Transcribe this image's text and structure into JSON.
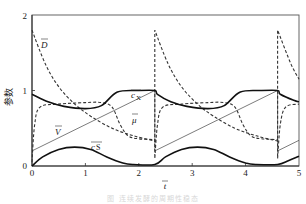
{
  "chart_data": {
    "type": "line",
    "title": "",
    "xlabel": "t̄",
    "ylabel": "参数",
    "xlim": [
      0,
      5
    ],
    "ylim": [
      0,
      2
    ],
    "x_ticks": [
      "0",
      "1",
      "2",
      "3",
      "4",
      "5"
    ],
    "y_ticks": [
      "0",
      "1",
      "2"
    ],
    "grid": false,
    "legend": "inline labels",
    "period": 2.3,
    "series": [
      {
        "name": "c̄x",
        "style": "solid-thick",
        "x": [
          0,
          0.3,
          0.6,
          1.0,
          1.3,
          1.6,
          2.0,
          2.3,
          2.35,
          2.6,
          2.9,
          3.3,
          3.6,
          3.9,
          4.3,
          4.6,
          4.65,
          4.9,
          5.0
        ],
        "values": [
          0.95,
          0.85,
          0.79,
          0.76,
          0.8,
          0.98,
          1.0,
          1.0,
          0.95,
          0.85,
          0.79,
          0.76,
          0.8,
          0.98,
          1.0,
          1.0,
          0.95,
          0.87,
          0.85
        ]
      },
      {
        "name": "μ̄",
        "style": "dashed",
        "x": [
          0,
          0.05,
          0.15,
          0.5,
          1.0,
          1.3,
          1.5,
          1.65,
          1.8,
          2.0,
          2.3,
          2.3,
          2.35,
          2.45,
          2.8,
          3.3,
          3.6,
          3.8,
          3.95,
          4.1,
          4.3,
          4.6,
          4.6,
          4.65,
          4.75,
          5.0
        ],
        "values": [
          0.05,
          0.55,
          0.78,
          0.82,
          0.84,
          0.84,
          0.78,
          0.55,
          0.4,
          0.36,
          0.35,
          0.1,
          0.55,
          0.78,
          0.82,
          0.84,
          0.84,
          0.78,
          0.55,
          0.4,
          0.36,
          0.35,
          0.1,
          0.55,
          0.78,
          0.82
        ]
      },
      {
        "name": "D̄",
        "style": "dashed",
        "x": [
          0,
          0.25,
          0.5,
          0.8,
          1.1,
          1.5,
          1.9,
          2.3,
          2.3,
          2.55,
          2.8,
          3.1,
          3.4,
          3.8,
          4.2,
          4.6,
          4.6,
          4.85,
          5.0
        ],
        "values": [
          1.8,
          1.35,
          1.05,
          0.82,
          0.66,
          0.5,
          0.4,
          0.33,
          1.8,
          1.35,
          1.05,
          0.82,
          0.66,
          0.5,
          0.4,
          0.33,
          1.8,
          1.35,
          1.15
        ]
      },
      {
        "name": "V̄",
        "style": "solid-thin",
        "x": [
          0,
          2.3,
          2.3,
          4.6,
          4.6,
          5.0
        ],
        "values": [
          0.2,
          1.0,
          0.2,
          1.0,
          0.2,
          0.34
        ]
      },
      {
        "name": "c̄s",
        "style": "solid-thick",
        "x": [
          0,
          0.2,
          0.5,
          0.8,
          1.1,
          1.4,
          1.7,
          1.9,
          2.3,
          2.5,
          2.8,
          3.1,
          3.4,
          3.7,
          4.0,
          4.2,
          4.6,
          4.8,
          5.0
        ],
        "values": [
          0.0,
          0.12,
          0.22,
          0.25,
          0.22,
          0.12,
          0.04,
          0.02,
          0.02,
          0.12,
          0.22,
          0.25,
          0.22,
          0.12,
          0.04,
          0.02,
          0.02,
          0.07,
          0.13
        ]
      }
    ],
    "annotations": [
      "D̄",
      "c̄x",
      "μ̄",
      "V̄",
      "c̄s"
    ]
  },
  "labels": {
    "D": "D",
    "cx": "c",
    "cx_sub": "X",
    "mu": "μ",
    "V": "V",
    "cs": "c",
    "cs_sub": "S",
    "xlabel": "t",
    "ylabel": "参数"
  },
  "ticks": {
    "x0": "0",
    "x1": "1",
    "x2": "2",
    "x3": "3",
    "x4": "4",
    "x5": "5",
    "y0": "0",
    "y1": "1",
    "y2": "2"
  },
  "caption": "图  连续发酵的周期性稳态"
}
